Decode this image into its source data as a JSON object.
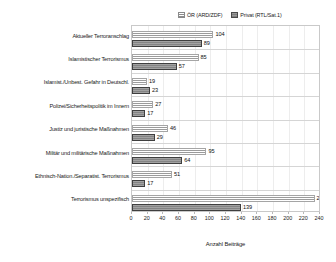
{
  "chart_data": {
    "type": "bar",
    "orientation": "horizontal",
    "title": "",
    "xlabel": "Anzahl Beiträge",
    "ylabel": "",
    "xlim": [
      0,
      240
    ],
    "xticks": [
      0,
      20,
      40,
      60,
      80,
      100,
      120,
      140,
      160,
      180,
      200,
      220,
      240
    ],
    "grid": true,
    "legend_position": "top-right",
    "categories": [
      "Aktueller Terroranschlag",
      "Islamistischer Terrorismus",
      "Islamist./Unbest. Gefahr in Deutschl.",
      "Polizei/Sicherheitspolitik im Innern",
      "Justiz und juristische Maßnahmen",
      "Militär und militärische Maßnahmen",
      "Ethnisch-Nation./Separatist. Terrorismus",
      "Terrorismus unspezifisch"
    ],
    "series": [
      {
        "name": "ÖR (ARD/ZDF)",
        "key": "oer",
        "color": "#ffffff",
        "values": [
          104,
          85,
          19,
          27,
          46,
          95,
          51,
          233
        ]
      },
      {
        "name": "Privat (RTL/Sat.1)",
        "key": "privat",
        "color": "#9a9a9a",
        "values": [
          89,
          57,
          23,
          17,
          29,
          64,
          17,
          139
        ]
      }
    ]
  },
  "legend": {
    "items": [
      {
        "label": "ÖR (ARD/ZDF)",
        "swatch": "oer"
      },
      {
        "label": "Privat (RTL/Sat.1)",
        "swatch": "privat"
      }
    ]
  },
  "axis": {
    "x_title": "Anzahl Beiträge"
  }
}
